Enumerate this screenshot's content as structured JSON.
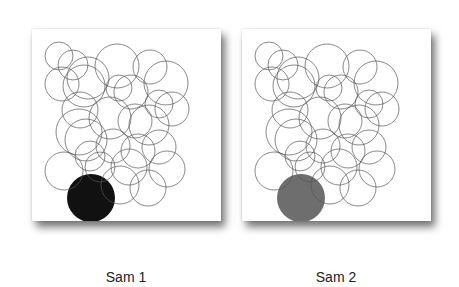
{
  "panels": [
    {
      "label": "Sam 1",
      "highlight_color": "#111111",
      "overlap_color": "#555555"
    },
    {
      "label": "Sam 2",
      "highlight_color": "#6e6e6e",
      "overlap_color": "#9a9a9a"
    }
  ],
  "circles": [
    [
      27,
      27,
      14
    ],
    [
      41,
      36,
      15
    ],
    [
      56,
      49,
      21
    ],
    [
      85,
      37,
      22
    ],
    [
      118,
      38,
      17
    ],
    [
      134,
      54,
      22
    ],
    [
      30,
      55,
      17
    ],
    [
      52,
      57,
      21
    ],
    [
      87,
      59,
      13
    ],
    [
      99,
      63,
      17
    ],
    [
      48,
      81,
      18
    ],
    [
      127,
      75,
      14
    ],
    [
      140,
      80,
      17
    ],
    [
      78,
      89,
      21
    ],
    [
      103,
      92,
      17
    ],
    [
      117,
      96,
      20
    ],
    [
      47,
      103,
      23
    ],
    [
      54,
      111,
      21
    ],
    [
      81,
      117,
      17
    ],
    [
      106,
      122,
      17
    ],
    [
      127,
      118,
      17
    ],
    [
      32,
      142,
      19
    ],
    [
      58,
      127,
      15
    ],
    [
      68,
      138,
      15
    ],
    [
      97,
      138,
      18
    ],
    [
      135,
      140,
      18
    ],
    [
      88,
      156,
      19
    ],
    [
      116,
      159,
      18
    ]
  ],
  "highlight": [
    59,
    169,
    24
  ]
}
